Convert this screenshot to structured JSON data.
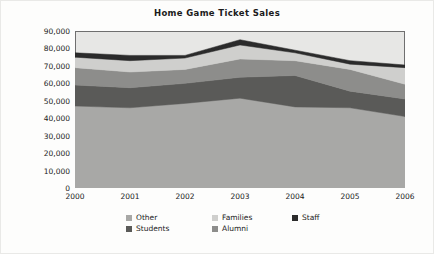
{
  "chart_data": {
    "type": "area",
    "stacked": true,
    "title": "Home Game Ticket Sales",
    "xlabel": "",
    "ylabel": "Average per Game",
    "x": [
      2000,
      2001,
      2002,
      2003,
      2004,
      2005,
      2006
    ],
    "categories": [
      "2000",
      "2001",
      "2002",
      "2003",
      "2004",
      "2005",
      "2006"
    ],
    "ylim": [
      0,
      90000
    ],
    "ytick_labels": [
      "90,000",
      "80,000",
      "70,000",
      "60,000",
      "50,000",
      "40,000",
      "30,000",
      "20,000",
      "10,000",
      "0"
    ],
    "ytick_values": [
      90000,
      80000,
      70000,
      60000,
      50000,
      40000,
      30000,
      20000,
      10000,
      0
    ],
    "ytick_step": 10000,
    "grid": false,
    "legend_position": "bottom",
    "stack_order_bottom_to_top": [
      "Other",
      "Students",
      "Alumni",
      "Families",
      "Staff"
    ],
    "series": [
      {
        "name": "Other",
        "color": "#a8a8a6",
        "values": [
          47000,
          46000,
          48500,
          51500,
          46500,
          46000,
          41000
        ]
      },
      {
        "name": "Students",
        "color": "#5a5a58",
        "values": [
          12000,
          11500,
          11500,
          12000,
          18000,
          9500,
          10000
        ]
      },
      {
        "name": "Alumni",
        "color": "#8d8d8b",
        "values": [
          10000,
          9000,
          8000,
          10500,
          8500,
          12500,
          8500
        ]
      },
      {
        "name": "Families",
        "color": "#cfcfcd",
        "values": [
          6000,
          6500,
          6500,
          8000,
          4500,
          3000,
          9500
        ]
      },
      {
        "name": "Staff",
        "color": "#2b2b2b",
        "values": [
          2500,
          3000,
          1500,
          3000,
          1500,
          2000,
          1500
        ]
      }
    ],
    "cumulative_totals": [
      77500,
      76000,
      76000,
      85000,
      79000,
      73000,
      70500
    ]
  },
  "legend": {
    "rows": [
      [
        {
          "label": "Other",
          "color": "#a8a8a6"
        },
        {
          "label": "Families",
          "color": "#cfcfcd"
        },
        {
          "label": "Staff",
          "color": "#2b2b2b"
        }
      ],
      [
        {
          "label": "Students",
          "color": "#5a5a58"
        },
        {
          "label": "Alumni",
          "color": "#8d8d8b"
        }
      ]
    ]
  },
  "colors": {
    "plot_background": "#e7e7e5",
    "axis_line": "#6f6f6f",
    "text": "#1b1b1b",
    "figure_background": "#fdfdfc"
  }
}
